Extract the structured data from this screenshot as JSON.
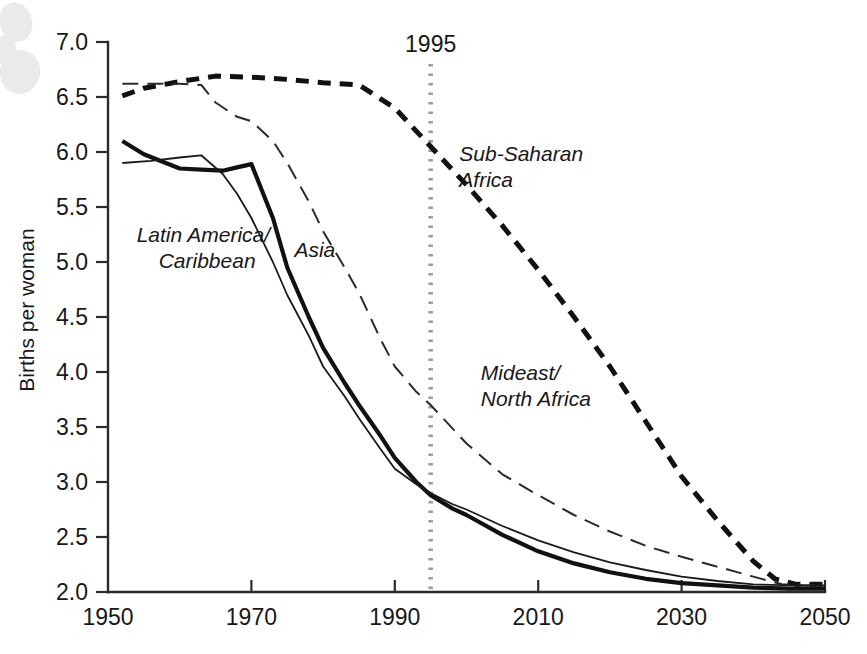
{
  "chart_data": {
    "type": "line",
    "title": "",
    "xlabel": "",
    "ylabel": "Births per woman",
    "xlim": [
      1950,
      2050
    ],
    "ylim": [
      2.0,
      7.0
    ],
    "grid": false,
    "legend_position": "inline-annotations",
    "xticks": [
      1950,
      1970,
      1990,
      2010,
      2030,
      2050
    ],
    "xtick_labels": [
      "1950",
      "1970",
      "1990",
      "2010",
      "2030",
      "2050"
    ],
    "yticks": [
      2.0,
      2.5,
      3.0,
      3.5,
      4.0,
      4.5,
      5.0,
      5.5,
      6.0,
      6.5,
      7.0
    ],
    "ytick_labels": [
      "2.0",
      "2.5",
      "3.0",
      "3.5",
      "4.0",
      "4.5",
      "5.0",
      "5.5",
      "6.0",
      "6.5",
      "7.0"
    ],
    "annotations": [
      {
        "text": "1995",
        "x": 1995,
        "type": "vertical-reference-line",
        "color": "#9a9a9a",
        "style": "dotted"
      }
    ],
    "series": [
      {
        "name": "Sub-Saharan Africa",
        "label": "Sub-Saharan Africa",
        "style": "thick-dashed",
        "color": "#111111",
        "width": 5.0,
        "dash": "13,9",
        "label_x": 1999,
        "label_y": 5.92,
        "x": [
          1952,
          1955,
          1960,
          1965,
          1970,
          1975,
          1980,
          1985,
          1990,
          1995,
          2000,
          2005,
          2010,
          2015,
          2020,
          2025,
          2030,
          2035,
          2040,
          2043,
          2046,
          2050
        ],
        "values": [
          6.51,
          6.58,
          6.64,
          6.69,
          6.68,
          6.66,
          6.63,
          6.61,
          6.4,
          6.05,
          5.7,
          5.33,
          4.93,
          4.5,
          4.05,
          3.55,
          3.05,
          2.65,
          2.28,
          2.12,
          2.07,
          2.07
        ]
      },
      {
        "name": "Mideast/North Africa",
        "label": "Mideast/ North Africa",
        "style": "thin-dashed",
        "color": "#2a2a2a",
        "width": 2.0,
        "dash": "16,9",
        "label_x": 2002,
        "label_y": 3.93,
        "x": [
          1952,
          1955,
          1960,
          1963,
          1965,
          1968,
          1970,
          1973,
          1975,
          1978,
          1980,
          1983,
          1985,
          1988,
          1990,
          1993,
          1995,
          2000,
          2005,
          2010,
          2015,
          2020,
          2025,
          2030,
          2035,
          2040,
          2044,
          2047,
          2050
        ],
        "values": [
          6.62,
          6.62,
          6.62,
          6.61,
          6.45,
          6.32,
          6.28,
          6.1,
          5.9,
          5.55,
          5.28,
          4.95,
          4.72,
          4.3,
          4.05,
          3.82,
          3.7,
          3.35,
          3.07,
          2.88,
          2.7,
          2.55,
          2.42,
          2.32,
          2.23,
          2.14,
          2.07,
          2.06,
          2.06
        ]
      },
      {
        "name": "Asia",
        "label": "Asia",
        "style": "thick-solid",
        "color": "#111111",
        "width": 4.2,
        "dash": "",
        "label_x": 1976,
        "label_y": 5.05,
        "x": [
          1952,
          1955,
          1960,
          1963,
          1966,
          1968,
          1970,
          1973,
          1975,
          1978,
          1980,
          1983,
          1985,
          1988,
          1990,
          1993,
          1995,
          1998,
          2000,
          2005,
          2010,
          2015,
          2020,
          2025,
          2030,
          2035,
          2040,
          2045,
          2050
        ],
        "values": [
          6.1,
          5.98,
          5.85,
          5.84,
          5.83,
          5.86,
          5.89,
          5.4,
          4.95,
          4.5,
          4.22,
          3.9,
          3.7,
          3.42,
          3.22,
          3.0,
          2.88,
          2.76,
          2.7,
          2.52,
          2.37,
          2.26,
          2.18,
          2.12,
          2.08,
          2.06,
          2.04,
          2.03,
          2.03
        ]
      },
      {
        "name": "Latin America/Caribbean",
        "label": "Latin America/ Caribbean",
        "style": "thin-solid",
        "color": "#1a1a1a",
        "width": 1.8,
        "dash": "",
        "label_x": 1954,
        "label_y": 5.18,
        "x": [
          1952,
          1956,
          1960,
          1963,
          1966,
          1968,
          1970,
          1973,
          1975,
          1978,
          1980,
          1983,
          1985,
          1988,
          1990,
          1993,
          1995,
          1998,
          2000,
          2005,
          2010,
          2015,
          2020,
          2025,
          2030,
          2035,
          2040,
          2045,
          2050
        ],
        "values": [
          5.9,
          5.92,
          5.95,
          5.97,
          5.8,
          5.62,
          5.4,
          5.0,
          4.7,
          4.33,
          4.05,
          3.78,
          3.58,
          3.3,
          3.12,
          2.98,
          2.9,
          2.8,
          2.75,
          2.6,
          2.47,
          2.36,
          2.27,
          2.2,
          2.14,
          2.1,
          2.07,
          2.06,
          2.06
        ]
      }
    ]
  },
  "series_labels": {
    "sub_saharan": {
      "line1": "Sub-Saharan",
      "line2": "Africa"
    },
    "mideast": {
      "line1": "Mideast/",
      "line2": "North Africa"
    },
    "asia": {
      "line1": "Asia"
    },
    "latin_america": {
      "line1": "Latin America/",
      "line2": "Caribbean"
    }
  },
  "axis": {
    "y_title": "Births per woman"
  },
  "reference": {
    "year_label": "1995"
  }
}
